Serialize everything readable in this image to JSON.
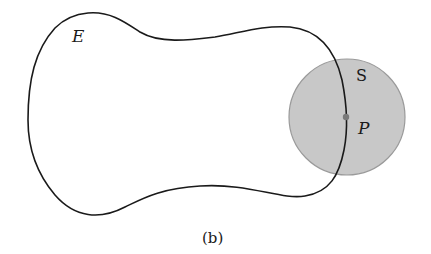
{
  "figure": {
    "caption": "(b)",
    "region_label": "E",
    "sphere_label": "S",
    "point_label": "P",
    "colors": {
      "background": "#ffffff",
      "curve": "#1a1a1a",
      "sphere_fill": "#c8c8c8",
      "sphere_stroke": "#9a9a9a",
      "point": "#7a7a7a"
    }
  }
}
